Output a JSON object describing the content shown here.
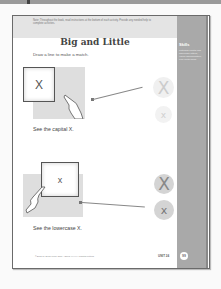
{
  "viewer": {
    "toolbar": "top-bar"
  },
  "page": {
    "header_note": "Note: Throughout the book, read instructions at the bottom of each activity. Provide any needed help to complete activities.",
    "title": "Big and Little",
    "instruction": "Draw a line to make a match.",
    "sidebar": {
      "title": "Skills",
      "text": "Matching capital and lowercase letters; Visual discrimination; Fine motor skills"
    },
    "activities": [
      {
        "card_letter": "X",
        "caption": "See the capital X.",
        "choices": [
          {
            "letter": "X",
            "size": "large",
            "matched": true
          },
          {
            "letter": "x",
            "size": "small",
            "matched": false
          }
        ]
      },
      {
        "card_letter": "x",
        "caption": "See the lowercase X.",
        "choices": [
          {
            "letter": "X",
            "size": "large",
            "matched": false
          },
          {
            "letter": "x",
            "size": "small",
            "matched": true
          }
        ]
      }
    ],
    "footer": {
      "copyright": "©2005 by Evan-Moor Corp. • EMC XXXX • Capital Letters",
      "unit": "UNIT 24",
      "page_number": "99"
    }
  },
  "colors": {
    "sidebar": "#a9a9a9",
    "header_band": "#e4e4e4",
    "circle_light": "#f0f0f0",
    "circle_dark": "#d4d4d4"
  }
}
